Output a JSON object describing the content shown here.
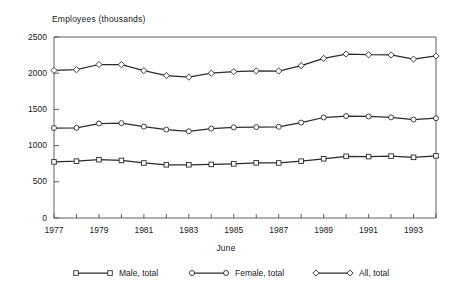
{
  "chart_data": {
    "type": "line",
    "title": "Employees (thousands)",
    "xlabel": "June",
    "ylabel": "",
    "ylim": [
      0,
      2500
    ],
    "yticks": [
      0,
      500,
      1000,
      1500,
      2000,
      2500
    ],
    "ytick_labels": [
      "0",
      "500",
      "1000",
      "1500",
      "2000",
      "2500"
    ],
    "x": [
      1977,
      1978,
      1979,
      1980,
      1981,
      1982,
      1983,
      1984,
      1985,
      1986,
      1987,
      1988,
      1989,
      1990,
      1991,
      1992,
      1993,
      1994
    ],
    "xtick_labels": [
      "1977",
      "",
      "1979",
      "",
      "1981",
      "",
      "1983",
      "",
      "1985",
      "",
      "1987",
      "",
      "1989",
      "",
      "1991",
      "",
      "1993",
      ""
    ],
    "xlim": [
      1977,
      1994
    ],
    "grid": false,
    "legend_position": "bottom",
    "series": [
      {
        "name": "Male, total",
        "marker": "square",
        "values": [
          775,
          785,
          805,
          795,
          760,
          735,
          735,
          740,
          748,
          762,
          760,
          785,
          818,
          852,
          848,
          855,
          838,
          858
        ]
      },
      {
        "name": "Female, total",
        "marker": "circle",
        "values": [
          1243,
          1245,
          1305,
          1310,
          1262,
          1222,
          1198,
          1235,
          1252,
          1255,
          1260,
          1318,
          1388,
          1408,
          1402,
          1390,
          1360,
          1378
        ]
      },
      {
        "name": "All, total",
        "marker": "diamond",
        "values": [
          2038,
          2048,
          2120,
          2118,
          2035,
          1968,
          1945,
          2000,
          2022,
          2032,
          2030,
          2105,
          2205,
          2265,
          2255,
          2252,
          2195,
          2238
        ]
      }
    ]
  },
  "legend": {
    "items": [
      {
        "label": "Male, total",
        "marker": "square"
      },
      {
        "label": "Female, total",
        "marker": "circle"
      },
      {
        "label": "All, total",
        "marker": "diamond"
      }
    ]
  },
  "colors": {
    "line": "#2b2b2b",
    "axis": "#4d4d4d",
    "marker_fill": "#ffffff",
    "text": "#1a1a1a"
  }
}
